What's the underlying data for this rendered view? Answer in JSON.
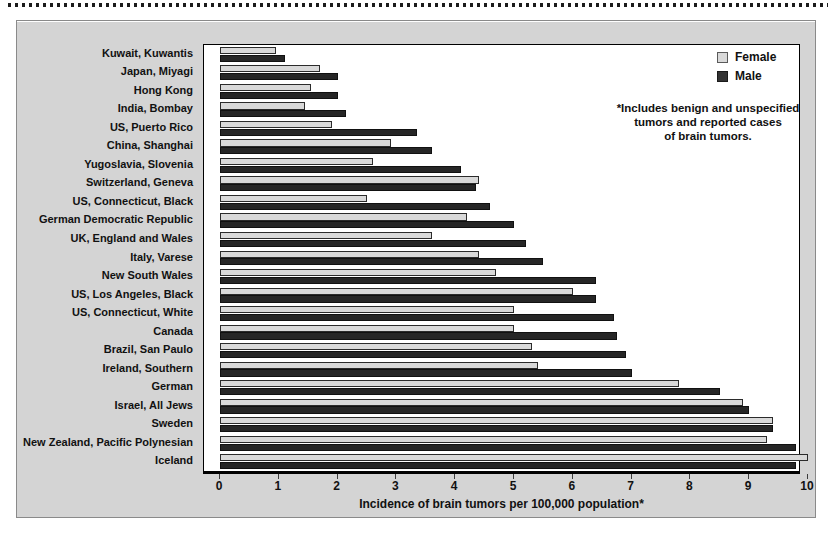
{
  "chart_data": {
    "type": "bar",
    "orientation": "horizontal",
    "title": "",
    "xlabel": "Incidence of brain tumors per 100,000 population*",
    "ylabel": "",
    "xlim": [
      0,
      10
    ],
    "xticks": [
      0,
      1,
      2,
      3,
      4,
      5,
      6,
      7,
      8,
      9,
      10
    ],
    "xtick_labels": [
      "0",
      "1",
      "2",
      "3",
      "4",
      "5",
      "6",
      "7",
      "8",
      "9",
      "10"
    ],
    "grid": false,
    "legend_position": "top-right",
    "categories": [
      "Kuwait, Kuwantis",
      "Japan, Miyagi",
      "Hong Kong",
      "India, Bombay",
      "US, Puerto Rico",
      "China, Shanghai",
      "Yugoslavia, Slovenia",
      "Switzerland, Geneva",
      "US, Connecticut, Black",
      "German Democratic Republic",
      "UK, England and Wales",
      "Italy, Varese",
      "New South Wales",
      "US, Los Angeles, Black",
      "US, Connecticut, White",
      "Canada",
      "Brazil, San Paulo",
      "Ireland, Southern",
      "German",
      "Israel, All Jews",
      "Sweden",
      "New Zealand, Pacific Polynesian",
      "Iceland"
    ],
    "series": [
      {
        "name": "Female",
        "color": "#d9d9d9",
        "values": [
          0.95,
          1.7,
          1.55,
          1.45,
          1.9,
          2.9,
          2.6,
          4.4,
          2.5,
          4.2,
          3.6,
          4.4,
          4.7,
          6.0,
          5.0,
          5.0,
          5.3,
          5.4,
          7.8,
          8.9,
          9.4,
          9.3,
          10.0
        ]
      },
      {
        "name": "Male",
        "color": "#262626",
        "values": [
          1.1,
          2.0,
          2.0,
          2.15,
          3.35,
          3.6,
          4.1,
          4.35,
          4.6,
          5.0,
          5.2,
          5.5,
          6.4,
          6.4,
          6.7,
          6.75,
          6.9,
          7.0,
          8.5,
          9.0,
          9.4,
          9.8,
          9.8
        ]
      }
    ],
    "legend": [
      {
        "label": "Female",
        "swatch": "light-grey"
      },
      {
        "label": "Male",
        "swatch": "dark-grey"
      }
    ],
    "annotations": [
      "*Includes benign and unspecified tumors and reported cases of brain tumors."
    ]
  },
  "footnote": {
    "line1": "*Includes benign and unspecified",
    "line2": "tumors and reported cases",
    "line3": "of brain tumors."
  }
}
